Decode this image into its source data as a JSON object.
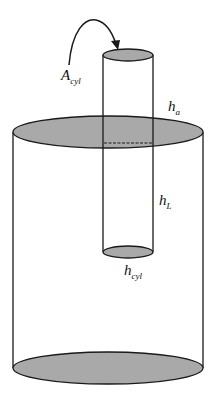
{
  "diagram": {
    "type": "two-cylinder schematic",
    "labels": {
      "area": {
        "main": "A",
        "sub": "cyl"
      },
      "h_a": {
        "main": "h",
        "sub": "a"
      },
      "h_L": {
        "main": "h",
        "sub": "L"
      },
      "h_cyl": {
        "main": "h",
        "sub": "cyl"
      }
    },
    "colors": {
      "fill": "#a9a9a9",
      "stroke": "#1a1a1a",
      "background": "#ffffff"
    }
  }
}
